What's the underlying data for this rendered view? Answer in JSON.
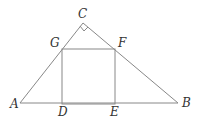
{
  "diagram": {
    "type": "geometry",
    "labels": {
      "A": "A",
      "B": "B",
      "C": "C",
      "D": "D",
      "E": "E",
      "F": "F",
      "G": "G"
    },
    "stroke_color": "#888888",
    "right_angle_at": "C"
  }
}
